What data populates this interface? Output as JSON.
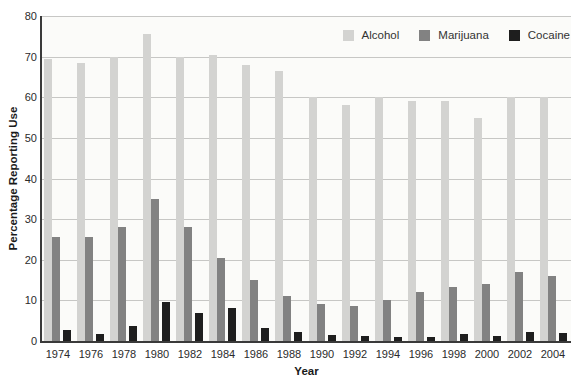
{
  "chart_data": {
    "type": "bar",
    "title": "",
    "xlabel": "Year",
    "ylabel": "Percentage Reporting Use",
    "ylim": [
      0,
      80
    ],
    "yticks": [
      0,
      10,
      20,
      30,
      40,
      50,
      60,
      70,
      80
    ],
    "grid": true,
    "legend_position": "top-right",
    "categories": [
      "1974",
      "1976",
      "1978",
      "1980",
      "1982",
      "1984",
      "1986",
      "1988",
      "1990",
      "1992",
      "1994",
      "1996",
      "1998",
      "2000",
      "2002",
      "2004"
    ],
    "series": [
      {
        "name": "Alcohol",
        "color": "#d3d3d1",
        "values": [
          69.5,
          68.5,
          70,
          75.5,
          70,
          70.5,
          68,
          66.5,
          60,
          58,
          60,
          59,
          59,
          55,
          60,
          60
        ]
      },
      {
        "name": "Marijuana",
        "color": "#828282",
        "values": [
          25.5,
          25.5,
          28,
          35,
          28,
          20.5,
          15,
          11,
          9,
          8.7,
          10,
          12,
          13.3,
          14,
          17,
          16
        ]
      },
      {
        "name": "Cocaine",
        "color": "#1e1e1e",
        "values": [
          2.7,
          1.7,
          3.8,
          9.5,
          7,
          8.2,
          3.3,
          2.3,
          1.4,
          1.3,
          1.1,
          0.9,
          1.8,
          1.3,
          2.1,
          2
        ]
      }
    ]
  },
  "colors": {
    "gridline": "#c7c7c5",
    "axis": "#3a3a3a",
    "plot_background": "#fbfbf9",
    "tick_text": "#2b2b2b",
    "axis_title_text": "#1a1a1a"
  }
}
